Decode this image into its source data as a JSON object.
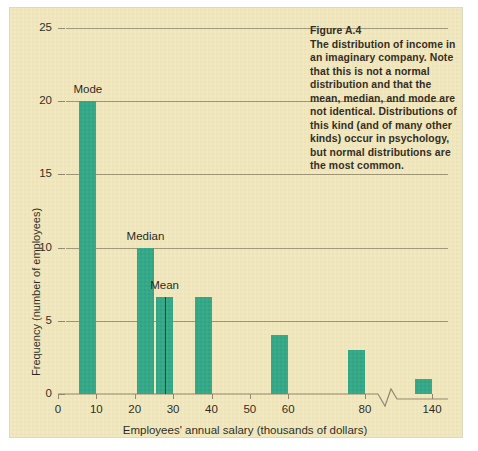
{
  "figure": {
    "background_color": "#f2e8bd",
    "bar_color": "#2aa583",
    "axis_color": "#8d8469",
    "mean_line_color": "#4a2b14"
  },
  "caption": {
    "title": "Figure A.4",
    "body": "The distribution of income in an imaginary company. Note that this is not a normal distribution and that the mean, median, and mode are not identical. Distributions of this kind (and of many other kinds) occur in psychology, but normal distributions are the most common."
  },
  "chart_data": {
    "type": "bar",
    "title": "",
    "xlabel": "Employees' annual salary (thousands of dollars)",
    "ylabel": "Frequency (number of employees)",
    "xtick_labels": [
      "0",
      "10",
      "20",
      "30",
      "40",
      "50",
      "60",
      "80",
      "140"
    ],
    "xtick_values": [
      0,
      10,
      20,
      30,
      40,
      50,
      60,
      80,
      140
    ],
    "ytick_labels": [
      "0",
      "5",
      "10",
      "15",
      "20",
      "25"
    ],
    "ylim": [
      0,
      25
    ],
    "grid": "horizontal",
    "legend": "none",
    "axis_break": {
      "present": true,
      "between": [
        80,
        140
      ],
      "style": "zigzag"
    },
    "categories": [
      10,
      25,
      30,
      40,
      60,
      80,
      140
    ],
    "values": [
      20,
      10,
      6.6,
      6.6,
      4,
      3,
      1
    ],
    "annotations": [
      {
        "label": "Mode",
        "category": 10,
        "value": 20
      },
      {
        "label": "Median",
        "category": 25,
        "value": 10
      },
      {
        "label": "Mean",
        "category": 30,
        "value": 6.6,
        "marker": "vertical-line"
      }
    ]
  }
}
